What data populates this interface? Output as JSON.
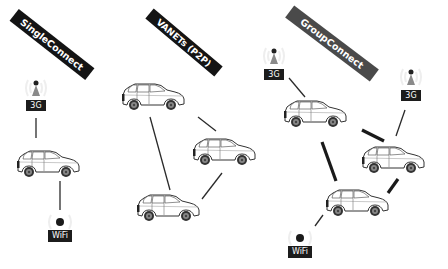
{
  "diagram": {
    "panels": [
      {
        "id": "single",
        "title": "SingleConnect"
      },
      {
        "id": "vanet",
        "title": "VANETs (P2P)"
      },
      {
        "id": "group",
        "title": "GroupConnect"
      }
    ],
    "labels": {
      "g3": "3G",
      "wifi": "WiFi"
    },
    "colors": {
      "banner_dark": "#141414",
      "banner_gray": "#4a4a4a",
      "badge": "#1c1c1c",
      "line": "#2a2a2a",
      "tower_cone": "#8a8a8a",
      "car_outline": "#333333"
    }
  }
}
